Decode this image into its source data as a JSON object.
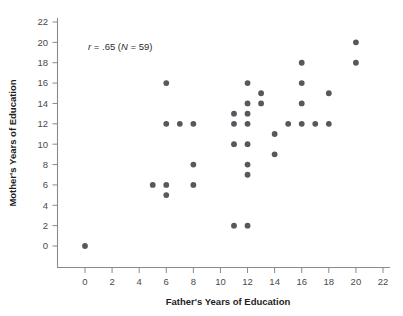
{
  "chart_data": {
    "type": "scatter",
    "title": "",
    "xlabel": "Father's Years of Education",
    "ylabel": "Mother's Years of Education",
    "xlim": [
      0,
      22
    ],
    "ylim": [
      0,
      22
    ],
    "xticks": [
      0,
      2,
      4,
      6,
      8,
      10,
      12,
      14,
      16,
      18,
      20,
      22
    ],
    "yticks": [
      0,
      2,
      4,
      6,
      8,
      10,
      12,
      14,
      16,
      18,
      20,
      22
    ],
    "xtick_labels": [
      "0",
      "2",
      "4",
      "6",
      "8",
      "10",
      "12",
      "14",
      "16",
      "18",
      "20",
      "22"
    ],
    "ytick_labels": [
      "0",
      "2",
      "4",
      "6",
      "8",
      "10",
      "12",
      "14",
      "16",
      "18",
      "20",
      "22"
    ],
    "grid": false,
    "legend": false,
    "marker_color": "#55585c",
    "annotation": "r = .65 (N = 59)",
    "annotation_parts": {
      "r_symbol": "r",
      "r_value": "= .65 (",
      "n_symbol": "N",
      "n_value": "= 59)"
    },
    "correlation_r": 0.65,
    "sample_size": 59,
    "points": [
      [
        0,
        0
      ],
      [
        5,
        6
      ],
      [
        6,
        16
      ],
      [
        6,
        12
      ],
      [
        6,
        6
      ],
      [
        6,
        5
      ],
      [
        7,
        12
      ],
      [
        8,
        12
      ],
      [
        8,
        8
      ],
      [
        8,
        6
      ],
      [
        11,
        13
      ],
      [
        11,
        12
      ],
      [
        11,
        10
      ],
      [
        11,
        2
      ],
      [
        12,
        16
      ],
      [
        12,
        14
      ],
      [
        12,
        13
      ],
      [
        12,
        12
      ],
      [
        12,
        10
      ],
      [
        12,
        8
      ],
      [
        12,
        7
      ],
      [
        12,
        2
      ],
      [
        13,
        15
      ],
      [
        13,
        14
      ],
      [
        14,
        11
      ],
      [
        14,
        9
      ],
      [
        15,
        12
      ],
      [
        16,
        18
      ],
      [
        16,
        16
      ],
      [
        16,
        14
      ],
      [
        16,
        12
      ],
      [
        17,
        12
      ],
      [
        18,
        15
      ],
      [
        18,
        12
      ],
      [
        20,
        20
      ],
      [
        20,
        18
      ]
    ]
  },
  "axes": {
    "x_axis_name": "x-axis",
    "y_axis_name": "y-axis"
  }
}
